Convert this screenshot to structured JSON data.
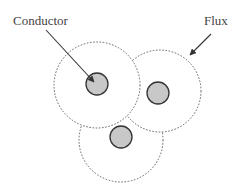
{
  "diagram": {
    "labels": {
      "conductor": "Conductor",
      "flux": "Flux"
    },
    "colors": {
      "flux_line": "#555555",
      "conductor_fill": "#c8c8c8",
      "conductor_stroke": "#333333",
      "arrow": "#333333",
      "text": "#444444"
    },
    "elements": {
      "flux_regions": 3,
      "conductors": 3
    }
  }
}
